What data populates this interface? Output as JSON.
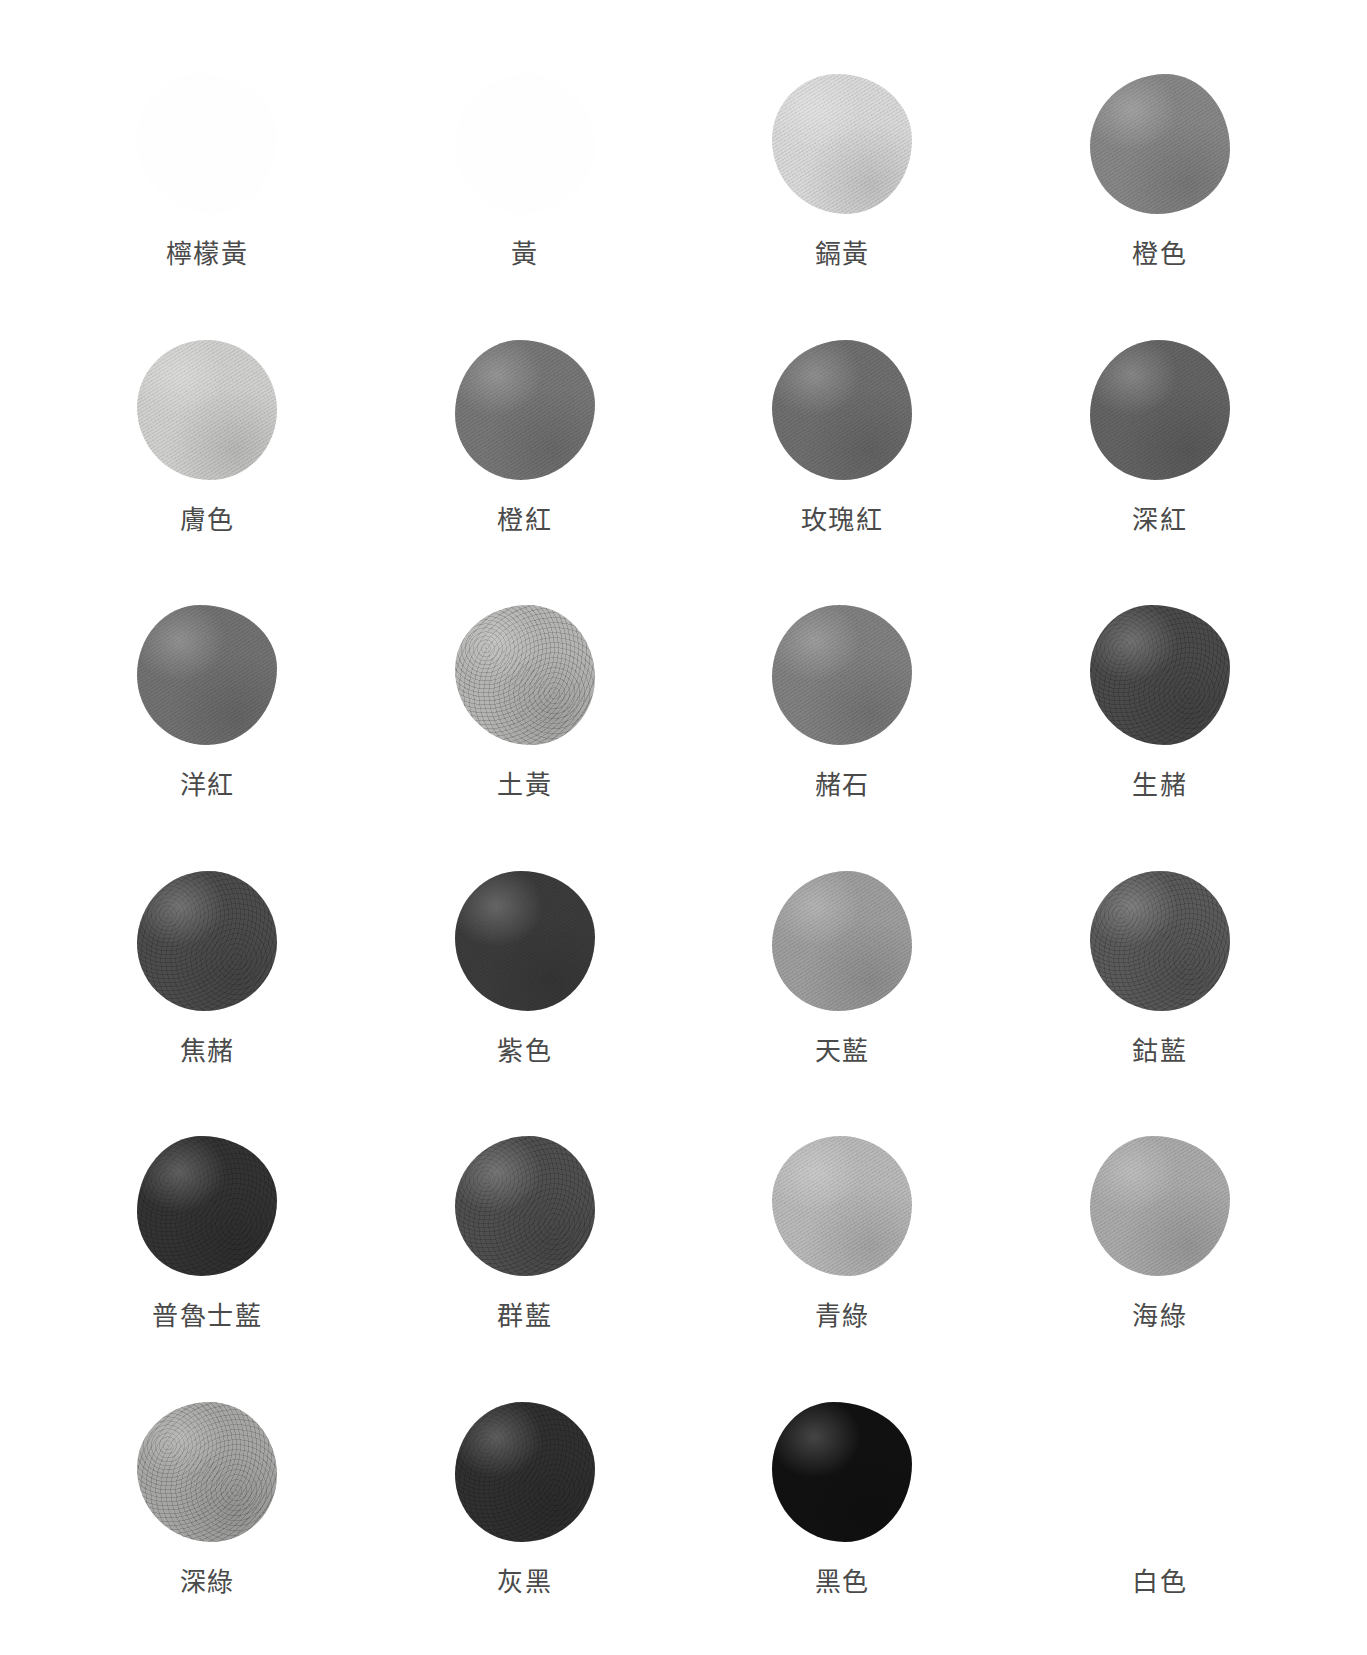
{
  "page": {
    "background_color": "#ffffff",
    "label_color": "#4a4a4a",
    "columns": 4,
    "rows": 6,
    "total_swatches": 24
  },
  "swatches": [
    {
      "label": "檸檬黃",
      "color": "#fefefe",
      "visible": false,
      "granular": false
    },
    {
      "label": "黃",
      "color": "#fefefe",
      "visible": false,
      "granular": false
    },
    {
      "label": "鎘黃",
      "color": "#d8d8d8",
      "visible": true,
      "granular": false
    },
    {
      "label": "橙色",
      "color": "#868686",
      "visible": true,
      "granular": false
    },
    {
      "label": "膚色",
      "color": "#cfcfcd",
      "visible": true,
      "granular": false
    },
    {
      "label": "橙紅",
      "color": "#767676",
      "visible": true,
      "granular": false
    },
    {
      "label": "玫瑰紅",
      "color": "#6e6e6e",
      "visible": true,
      "granular": false
    },
    {
      "label": "深紅",
      "color": "#636363",
      "visible": true,
      "granular": false
    },
    {
      "label": "洋紅",
      "color": "#717171",
      "visible": true,
      "granular": false
    },
    {
      "label": "土黃",
      "color": "#b4b4b2",
      "visible": true,
      "granular": true
    },
    {
      "label": "赭石",
      "color": "#808080",
      "visible": true,
      "granular": false
    },
    {
      "label": "生赭",
      "color": "#4a4a4a",
      "visible": true,
      "granular": true
    },
    {
      "label": "焦赭",
      "color": "#4c4c4c",
      "visible": true,
      "granular": true
    },
    {
      "label": "紫色",
      "color": "#3b3b3b",
      "visible": true,
      "granular": false
    },
    {
      "label": "天藍",
      "color": "#9d9d9d",
      "visible": true,
      "granular": false
    },
    {
      "label": "鈷藍",
      "color": "#5a5a5a",
      "visible": true,
      "granular": true
    },
    {
      "label": "普魯士藍",
      "color": "#333333",
      "visible": true,
      "granular": true
    },
    {
      "label": "群藍",
      "color": "#4f4f4f",
      "visible": true,
      "granular": true
    },
    {
      "label": "青綠",
      "color": "#b8b8b8",
      "visible": true,
      "granular": false
    },
    {
      "label": "海綠",
      "color": "#a9a9a9",
      "visible": true,
      "granular": false
    },
    {
      "label": "深綠",
      "color": "#a6a6a4",
      "visible": true,
      "granular": true
    },
    {
      "label": "灰黑",
      "color": "#303030",
      "visible": true,
      "granular": true
    },
    {
      "label": "黑色",
      "color": "#111111",
      "visible": true,
      "granular": false
    },
    {
      "label": "白色",
      "color": "#ffffff",
      "visible": false,
      "granular": false
    }
  ]
}
